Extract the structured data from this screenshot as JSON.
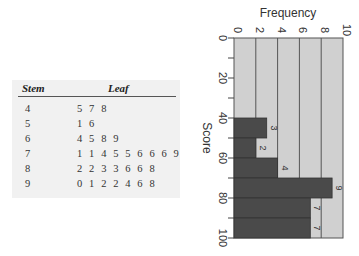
{
  "table": {
    "headers": {
      "stem": "Stem",
      "leaf": "Leaf"
    },
    "rows": [
      {
        "stem": "4",
        "leaf": "5 7 8"
      },
      {
        "stem": "5",
        "leaf": "1 6"
      },
      {
        "stem": "6",
        "leaf": "4 5 8 9"
      },
      {
        "stem": "7",
        "leaf": "1 1 4 5 5 6 6 6 9"
      },
      {
        "stem": "8",
        "leaf": "2 2 3 3 6 6 8"
      },
      {
        "stem": "9",
        "leaf": "0 1 2 2 4 6 8"
      }
    ]
  },
  "chart_data": {
    "type": "bar",
    "orientation": "rotated-90-clockwise",
    "title": "",
    "xlabel": "Score",
    "ylabel": "Frequency",
    "bins": [
      "40-50",
      "50-60",
      "60-70",
      "70-80",
      "80-90",
      "90-100"
    ],
    "bin_edges": [
      40,
      50,
      60,
      70,
      80,
      90,
      100
    ],
    "values": [
      3,
      2,
      4,
      9,
      7,
      7
    ],
    "data_labels": [
      "3",
      "2",
      "4",
      "9",
      "7",
      "7"
    ],
    "score_ticks": [
      "0",
      "20",
      "40",
      "60",
      "80",
      "100"
    ],
    "frequency_ticks": [
      "0",
      "2",
      "4",
      "6",
      "8",
      "10"
    ],
    "score_range": [
      0,
      100
    ],
    "frequency_range": [
      0,
      10
    ],
    "grid": true,
    "colors": {
      "bar": "#4a4a4a",
      "background": "#d0d0d0",
      "grid": "#555555"
    }
  }
}
